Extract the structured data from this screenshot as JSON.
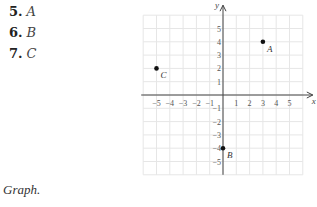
{
  "exercises": [
    {
      "number": "5.",
      "label": "A"
    },
    {
      "number": "6.",
      "label": "B"
    },
    {
      "number": "7.",
      "label": "C"
    }
  ],
  "caption": "Graph.",
  "chart_data": {
    "type": "scatter",
    "title": "",
    "xlabel": "x",
    "ylabel": "y",
    "xlim": [
      -6,
      6
    ],
    "ylim": [
      -6,
      6
    ],
    "grid": true,
    "xticks": [
      -5,
      -4,
      -3,
      -2,
      -1,
      1,
      2,
      3,
      4,
      5
    ],
    "yticks": [
      -5,
      -4,
      -3,
      -2,
      -1,
      1,
      2,
      3,
      4,
      5
    ],
    "points": [
      {
        "label": "A",
        "x": 3,
        "y": 4
      },
      {
        "label": "B",
        "x": 0,
        "y": -4
      },
      {
        "label": "C",
        "x": -5,
        "y": 2
      }
    ]
  }
}
